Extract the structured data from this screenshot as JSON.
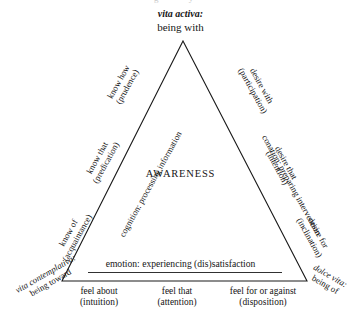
{
  "figure": {
    "title_center": "AWARENESS",
    "top_cutoff_artifact": "g      y",
    "apex": {
      "line1": "vita activa:",
      "line2": "being with"
    },
    "corners": {
      "bottom_left": {
        "line1": "vita contemplativa:",
        "line2": "being toward"
      },
      "bottom_right": {
        "line1": "dolce vita:",
        "line2": "being of"
      }
    },
    "edges": {
      "bottom_inner": "emotion: experiencing (dis)satisfaction",
      "left_inner": "cognition: processing information",
      "right_inner": "conation: preparing intervention"
    },
    "left_leg_labels": [
      {
        "line1": "know how",
        "line2": "(prudence)"
      },
      {
        "line1": "know that",
        "line2": "(predication)"
      },
      {
        "line1": "know of",
        "line2": "(acquaintance)"
      }
    ],
    "right_leg_labels": [
      {
        "line1": "desire with",
        "line2": "(participation)"
      },
      {
        "line1": "desire that",
        "line2": "(intention)"
      },
      {
        "line1": "desire for",
        "line2": "(inclination)"
      }
    ],
    "bottom_labels": [
      {
        "line1": "feel about",
        "line2": "(intuition)"
      },
      {
        "line1": "feel that",
        "line2": "(attention)"
      },
      {
        "line1": "feel for or against",
        "line2": "(disposition)"
      }
    ],
    "colors": {
      "background": "#ffffff",
      "ink": "#151515",
      "stroke": "#1a1a1a"
    }
  }
}
